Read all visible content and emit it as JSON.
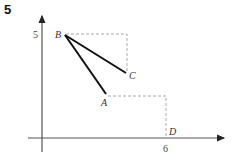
{
  "question": {
    "number": "5"
  },
  "axes": {
    "y_tick_label": "5",
    "x_tick_label": "6"
  },
  "points": {
    "A": {
      "label": "A",
      "coord": ""
    },
    "B": {
      "label": "B",
      "coord": "(?, 5)"
    },
    "C": {
      "label": "C"
    },
    "D": {
      "label": "D",
      "coord": "(6, 0)"
    }
  },
  "segments": [
    "BA",
    "BC"
  ],
  "dashed_guides": [
    "B to corner above C",
    "corner down to C",
    "A to corner above D",
    "corner down to D"
  ],
  "colors": {
    "line": "#111111",
    "axis": "#555555",
    "dashed": "#aaaaaa"
  }
}
